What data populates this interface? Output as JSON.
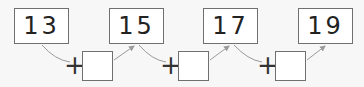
{
  "sequence": {
    "numbers": [
      "13",
      "15",
      "17",
      "19"
    ],
    "operator": "+",
    "blanks": [
      "",
      "",
      ""
    ]
  },
  "colors": {
    "background": "#f7f7f7",
    "box_border": "#707070",
    "arrow": "#9a9a9a",
    "text": "#222222"
  }
}
